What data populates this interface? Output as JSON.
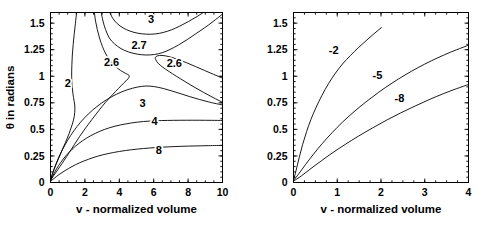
{
  "figure": {
    "background": "#ffffff",
    "line_color": "#000000",
    "panel_count": 2
  },
  "chart_data": [
    {
      "type": "line",
      "panel": "left",
      "title": "",
      "xlabel": "v - normalized volume",
      "ylabel": "θ in radians",
      "xlim": [
        0,
        10
      ],
      "ylim": [
        0,
        1.6
      ],
      "xticks": [
        0,
        2,
        4,
        6,
        8,
        10
      ],
      "xticklabels": [
        "0",
        "2",
        "4",
        "6",
        "8",
        "10"
      ],
      "yticks": [
        0,
        0.25,
        0.5,
        0.75,
        1,
        1.25,
        1.5
      ],
      "yticklabels": [
        "0",
        "0.25",
        "0.5",
        "0.75",
        "1",
        "1.25",
        "1.5"
      ],
      "grid": false,
      "legend": "none",
      "annotations": [
        {
          "text": "3",
          "x": 5.85,
          "y": 1.5
        },
        {
          "text": "2.7",
          "x": 5.15,
          "y": 1.255
        },
        {
          "text": "2.6",
          "x": 3.55,
          "y": 1.1
        },
        {
          "text": "2.6",
          "x": 7.2,
          "y": 1.085
        },
        {
          "text": "2",
          "x": 1.0,
          "y": 0.895
        },
        {
          "text": "3",
          "x": 5.35,
          "y": 0.715
        },
        {
          "text": "4",
          "x": 6.05,
          "y": 0.545
        },
        {
          "text": "8",
          "x": 6.3,
          "y": 0.265
        }
      ],
      "series": [
        {
          "name": "contour-2",
          "label": "2",
          "points": [
            [
              1.52,
              1.6
            ],
            [
              1.45,
              1.5
            ],
            [
              1.38,
              1.4
            ],
            [
              1.32,
              1.3
            ],
            [
              1.27,
              1.2
            ],
            [
              1.24,
              1.1
            ],
            [
              1.23,
              1.0
            ],
            [
              1.25,
              0.92
            ],
            [
              1.3,
              0.84
            ],
            [
              1.38,
              0.76
            ],
            [
              1.42,
              0.7
            ],
            [
              1.38,
              0.62
            ],
            [
              1.25,
              0.54
            ],
            [
              1.08,
              0.46
            ],
            [
              0.88,
              0.38
            ],
            [
              0.66,
              0.3
            ],
            [
              0.45,
              0.22
            ],
            [
              0.26,
              0.145
            ],
            [
              0.12,
              0.085
            ],
            [
              0.04,
              0.045
            ],
            [
              0.0,
              0.02
            ]
          ]
        },
        {
          "name": "contour-2.6-upper-left",
          "label": "2.6",
          "points": [
            [
              2.55,
              1.6
            ],
            [
              2.62,
              1.52
            ],
            [
              2.72,
              1.44
            ],
            [
              2.85,
              1.36
            ],
            [
              3.02,
              1.28
            ],
            [
              3.25,
              1.2
            ],
            [
              3.55,
              1.13
            ],
            [
              3.9,
              1.075
            ],
            [
              4.22,
              1.04
            ],
            [
              4.45,
              1.02
            ],
            [
              4.58,
              1.005
            ],
            [
              4.5,
              0.975
            ],
            [
              4.25,
              0.935
            ],
            [
              3.95,
              0.885
            ],
            [
              3.6,
              0.825
            ],
            [
              3.2,
              0.755
            ],
            [
              2.8,
              0.675
            ],
            [
              2.42,
              0.595
            ],
            [
              2.05,
              0.515
            ],
            [
              1.7,
              0.435
            ],
            [
              1.38,
              0.355
            ],
            [
              1.08,
              0.28
            ],
            [
              0.8,
              0.21
            ],
            [
              0.55,
              0.15
            ],
            [
              0.34,
              0.1
            ],
            [
              0.17,
              0.062
            ],
            [
              0.06,
              0.035
            ],
            [
              0.0,
              0.018
            ]
          ]
        },
        {
          "name": "contour-2.7-upper",
          "label": "2.7",
          "points": [
            [
              2.95,
              1.6
            ],
            [
              3.05,
              1.52
            ],
            [
              3.2,
              1.44
            ],
            [
              3.42,
              1.36
            ],
            [
              3.72,
              1.305
            ],
            [
              4.1,
              1.26
            ],
            [
              4.55,
              1.228
            ],
            [
              5.05,
              1.208
            ],
            [
              5.55,
              1.2
            ],
            [
              6.05,
              1.205
            ],
            [
              6.5,
              1.222
            ],
            [
              6.95,
              1.252
            ],
            [
              7.45,
              1.295
            ],
            [
              7.95,
              1.345
            ],
            [
              8.45,
              1.4
            ],
            [
              8.95,
              1.455
            ],
            [
              9.45,
              1.515
            ],
            [
              10.0,
              1.585
            ]
          ]
        },
        {
          "name": "contour-3-upper",
          "label": "3",
          "points": [
            [
              3.45,
              1.6
            ],
            [
              3.62,
              1.545
            ],
            [
              3.88,
              1.495
            ],
            [
              4.22,
              1.455
            ],
            [
              4.62,
              1.425
            ],
            [
              5.08,
              1.405
            ],
            [
              5.58,
              1.396
            ],
            [
              6.08,
              1.398
            ],
            [
              6.55,
              1.412
            ],
            [
              7.02,
              1.436
            ],
            [
              7.52,
              1.472
            ],
            [
              8.02,
              1.515
            ],
            [
              8.52,
              1.562
            ],
            [
              9.02,
              1.615
            ]
          ]
        },
        {
          "name": "contour-2.6-right-nose",
          "label": "2.6",
          "points": [
            [
              10.0,
              0.755
            ],
            [
              9.45,
              0.8
            ],
            [
              8.9,
              0.848
            ],
            [
              8.35,
              0.898
            ],
            [
              7.82,
              0.95
            ],
            [
              7.32,
              1.0
            ],
            [
              6.88,
              1.046
            ],
            [
              6.52,
              1.086
            ],
            [
              6.26,
              1.122
            ],
            [
              6.12,
              1.155
            ],
            [
              6.1,
              1.178
            ],
            [
              6.22,
              1.192
            ],
            [
              6.48,
              1.196
            ],
            [
              6.88,
              1.185
            ],
            [
              7.38,
              1.16
            ],
            [
              7.9,
              1.128
            ],
            [
              8.42,
              1.092
            ],
            [
              8.95,
              1.055
            ],
            [
              9.48,
              1.018
            ],
            [
              10.0,
              0.982
            ]
          ]
        },
        {
          "name": "contour-3-saddle-lower",
          "label": "3",
          "points": [
            [
              0.0,
              0.022
            ],
            [
              0.1,
              0.075
            ],
            [
              0.25,
              0.145
            ],
            [
              0.45,
              0.225
            ],
            [
              0.7,
              0.31
            ],
            [
              1.0,
              0.398
            ],
            [
              1.35,
              0.485
            ],
            [
              1.75,
              0.568
            ],
            [
              2.2,
              0.645
            ],
            [
              2.7,
              0.715
            ],
            [
              3.25,
              0.778
            ],
            [
              3.85,
              0.832
            ],
            [
              4.45,
              0.872
            ],
            [
              5.05,
              0.898
            ],
            [
              5.55,
              0.908
            ],
            [
              6.05,
              0.902
            ],
            [
              6.55,
              0.885
            ],
            [
              7.05,
              0.862
            ],
            [
              7.58,
              0.835
            ],
            [
              8.1,
              0.808
            ],
            [
              8.65,
              0.782
            ],
            [
              9.2,
              0.758
            ],
            [
              9.75,
              0.738
            ],
            [
              10.0,
              0.73
            ]
          ]
        },
        {
          "name": "contour-4",
          "label": "4",
          "points": [
            [
              0.0,
              0.018
            ],
            [
              0.15,
              0.068
            ],
            [
              0.35,
              0.128
            ],
            [
              0.6,
              0.19
            ],
            [
              0.9,
              0.252
            ],
            [
              1.25,
              0.312
            ],
            [
              1.65,
              0.368
            ],
            [
              2.1,
              0.418
            ],
            [
              2.6,
              0.462
            ],
            [
              3.15,
              0.5
            ],
            [
              3.75,
              0.53
            ],
            [
              4.4,
              0.552
            ],
            [
              5.05,
              0.568
            ],
            [
              5.75,
              0.578
            ],
            [
              6.45,
              0.583
            ],
            [
              7.15,
              0.585
            ],
            [
              7.9,
              0.586
            ],
            [
              8.65,
              0.586
            ],
            [
              9.35,
              0.585
            ],
            [
              10.0,
              0.584
            ]
          ]
        },
        {
          "name": "contour-8",
          "label": "8",
          "points": [
            [
              0.0,
              0.012
            ],
            [
              0.22,
              0.04
            ],
            [
              0.5,
              0.075
            ],
            [
              0.85,
              0.112
            ],
            [
              1.25,
              0.15
            ],
            [
              1.7,
              0.186
            ],
            [
              2.2,
              0.218
            ],
            [
              2.75,
              0.248
            ],
            [
              3.35,
              0.272
            ],
            [
              4.0,
              0.292
            ],
            [
              4.7,
              0.308
            ],
            [
              5.4,
              0.32
            ],
            [
              6.15,
              0.329
            ],
            [
              6.9,
              0.336
            ],
            [
              7.65,
              0.341
            ],
            [
              8.4,
              0.344
            ],
            [
              9.2,
              0.347
            ],
            [
              10.0,
              0.349
            ]
          ]
        }
      ]
    },
    {
      "type": "line",
      "panel": "right",
      "title": "",
      "xlabel": "v - normalized volume",
      "ylabel": "",
      "xlim": [
        0,
        4
      ],
      "ylim": [
        0,
        1.6
      ],
      "xticks": [
        0,
        1,
        2,
        3,
        4
      ],
      "xticklabels": [
        "0",
        "1",
        "2",
        "3",
        "4"
      ],
      "yticks": [
        0,
        0.25,
        0.5,
        0.75,
        1,
        1.25,
        1.5
      ],
      "yticklabels": [
        "0",
        "0.25",
        "0.5",
        "0.75",
        "1",
        "1.25",
        "1.5"
      ],
      "grid": false,
      "legend": "none",
      "annotations": [
        {
          "text": "-2",
          "x": 0.92,
          "y": 1.205
        },
        {
          "text": "-5",
          "x": 1.92,
          "y": 0.97
        },
        {
          "text": "-8",
          "x": 2.42,
          "y": 0.762
        }
      ],
      "series": [
        {
          "name": "contour-minus-2",
          "label": "-2",
          "points": [
            [
              0.0,
              0.022
            ],
            [
              0.06,
              0.115
            ],
            [
              0.13,
              0.235
            ],
            [
              0.21,
              0.36
            ],
            [
              0.3,
              0.48
            ],
            [
              0.4,
              0.595
            ],
            [
              0.52,
              0.71
            ],
            [
              0.65,
              0.82
            ],
            [
              0.8,
              0.93
            ],
            [
              0.96,
              1.03
            ],
            [
              1.12,
              1.115
            ],
            [
              1.3,
              1.195
            ],
            [
              1.48,
              1.268
            ],
            [
              1.66,
              1.335
            ],
            [
              1.84,
              1.4
            ],
            [
              2.0,
              1.455
            ],
            [
              2.0,
              1.455
            ]
          ]
        },
        {
          "name": "contour-minus-5",
          "label": "-5",
          "points": [
            [
              0.0,
              0.018
            ],
            [
              0.12,
              0.082
            ],
            [
              0.28,
              0.172
            ],
            [
              0.46,
              0.268
            ],
            [
              0.66,
              0.368
            ],
            [
              0.88,
              0.468
            ],
            [
              1.12,
              0.568
            ],
            [
              1.38,
              0.665
            ],
            [
              1.66,
              0.76
            ],
            [
              1.95,
              0.85
            ],
            [
              2.25,
              0.935
            ],
            [
              2.55,
              1.012
            ],
            [
              2.85,
              1.082
            ],
            [
              3.15,
              1.145
            ],
            [
              3.45,
              1.202
            ],
            [
              3.72,
              1.248
            ],
            [
              4.0,
              1.292
            ]
          ]
        },
        {
          "name": "contour-minus-8",
          "label": "-8",
          "points": [
            [
              0.0,
              0.012
            ],
            [
              0.18,
              0.062
            ],
            [
              0.4,
              0.132
            ],
            [
              0.64,
              0.205
            ],
            [
              0.9,
              0.282
            ],
            [
              1.18,
              0.358
            ],
            [
              1.48,
              0.435
            ],
            [
              1.8,
              0.512
            ],
            [
              2.12,
              0.585
            ],
            [
              2.45,
              0.655
            ],
            [
              2.78,
              0.72
            ],
            [
              3.1,
              0.78
            ],
            [
              3.42,
              0.835
            ],
            [
              3.72,
              0.882
            ],
            [
              4.0,
              0.922
            ]
          ]
        }
      ]
    }
  ]
}
